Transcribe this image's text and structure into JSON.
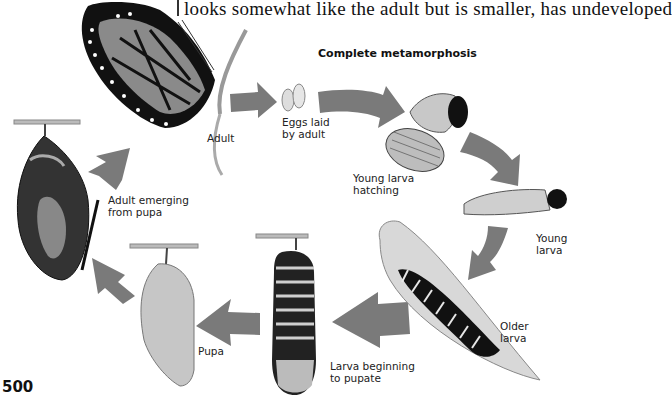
{
  "page": {
    "header_text": "looks somewhat like the adult but is smaller, has undeveloped",
    "page_number": "500"
  },
  "diagram": {
    "title": "Complete metamorphosis",
    "arrow_color": "#7a7a7a",
    "stages": [
      {
        "id": "adult",
        "label": "Adult"
      },
      {
        "id": "eggs",
        "label": "Eggs laid\nby adult"
      },
      {
        "id": "young-larva-hatching",
        "label": "Young larva\nhatching"
      },
      {
        "id": "young-larva",
        "label": "Young\nlarva"
      },
      {
        "id": "older-larva",
        "label": "Older\nlarva"
      },
      {
        "id": "larva-beginning-to-pupate",
        "label": "Larva beginning\nto pupate"
      },
      {
        "id": "pupa",
        "label": "Pupa"
      },
      {
        "id": "adult-emerging",
        "label": "Adult emerging\nfrom pupa"
      }
    ]
  }
}
